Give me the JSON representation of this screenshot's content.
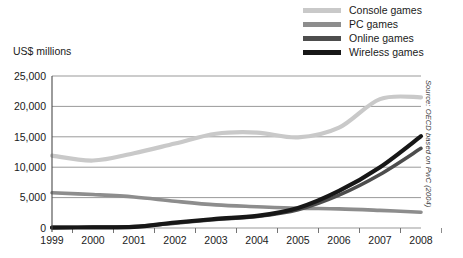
{
  "axis_title": "US$ millions",
  "source_note": "Source: OECD based on PwC (2004)",
  "legend": {
    "items": [
      {
        "label": "Console games",
        "color": "#c9c9c9",
        "swatch_name": "legend-swatch-console"
      },
      {
        "label": "PC games",
        "color": "#8d8d8d",
        "swatch_name": "legend-swatch-pc"
      },
      {
        "label": "Online games",
        "color": "#4d4d4d",
        "swatch_name": "legend-swatch-online"
      },
      {
        "label": "Wireless games",
        "color": "#171717",
        "swatch_name": "legend-swatch-wireless"
      }
    ]
  },
  "chart_data": {
    "type": "line",
    "title": "",
    "xlabel": "",
    "ylabel": "US$ millions",
    "ylim": [
      0,
      25000
    ],
    "xlim": [
      1999,
      2008
    ],
    "grid": true,
    "legend_position": "top-right",
    "categories": [
      "1999",
      "2000",
      "2001",
      "2002",
      "2003",
      "2004",
      "2005",
      "2006",
      "2007",
      "2008"
    ],
    "x": [
      1999,
      2000,
      2001,
      2002,
      2003,
      2004,
      2005,
      2006,
      2007,
      2008
    ],
    "ytick_labels": [
      "25,000",
      "20,000",
      "15,000",
      "10,000",
      "5,000",
      "0"
    ],
    "ytick_values": [
      25000,
      20000,
      15000,
      10000,
      5000,
      0
    ],
    "series": [
      {
        "name": "Console games",
        "color": "#c9c9c9",
        "width": 4.2,
        "values": [
          11900,
          11100,
          12300,
          13900,
          15500,
          15700,
          14900,
          16500,
          21200,
          21500
        ]
      },
      {
        "name": "PC games",
        "color": "#8d8d8d",
        "width": 3.6,
        "values": [
          5800,
          5500,
          5100,
          4400,
          3800,
          3500,
          3250,
          3150,
          2900,
          2600
        ]
      },
      {
        "name": "Online games",
        "color": "#4d4d4d",
        "width": 3.6,
        "values": [
          100,
          150,
          250,
          800,
          1400,
          1900,
          3000,
          5400,
          8800,
          13100
        ]
      },
      {
        "name": "Wireless games",
        "color": "#171717",
        "width": 4.2,
        "values": [
          60,
          100,
          180,
          900,
          1500,
          2000,
          3300,
          6100,
          10000,
          15100
        ]
      }
    ]
  }
}
